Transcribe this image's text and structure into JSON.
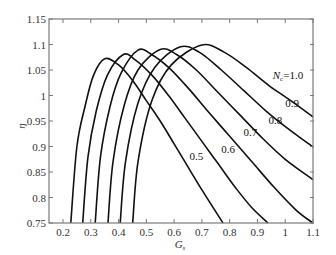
{
  "chart_data": {
    "type": "line",
    "title": "",
    "xlabel": "G_s",
    "ylabel": "η",
    "xlim": [
      0.15,
      1.1
    ],
    "ylim": [
      0.75,
      1.15
    ],
    "grid": false,
    "legend_position": "inline labels",
    "x_ticks": [
      0.2,
      0.3,
      0.4,
      0.5,
      0.6,
      0.7,
      0.8,
      0.9,
      1,
      1.1
    ],
    "y_ticks": [
      0.75,
      0.8,
      0.85,
      0.9,
      0.95,
      1,
      1.05,
      1.1,
      1.15
    ],
    "series": [
      {
        "name": "0.5",
        "label": "0.5",
        "x": [
          0.228,
          0.25,
          0.28,
          0.31,
          0.35,
          0.4,
          0.45,
          0.5,
          0.55,
          0.6,
          0.65,
          0.7,
          0.776
        ],
        "y": [
          0.75,
          0.9,
          0.98,
          1.04,
          1.072,
          1.06,
          1.03,
          0.99,
          0.95,
          0.905,
          0.86,
          0.815,
          0.75
        ]
      },
      {
        "name": "0.6",
        "label": "0.6",
        "x": [
          0.271,
          0.29,
          0.32,
          0.36,
          0.416,
          0.46,
          0.52,
          0.58,
          0.64,
          0.7,
          0.76,
          0.82,
          0.88,
          0.938
        ],
        "y": [
          0.75,
          0.88,
          0.97,
          1.04,
          1.08,
          1.07,
          1.04,
          1.0,
          0.955,
          0.91,
          0.865,
          0.82,
          0.78,
          0.75
        ]
      },
      {
        "name": "0.7",
        "label": "0.7",
        "x": [
          0.316,
          0.335,
          0.37,
          0.41,
          0.47,
          0.52,
          0.58,
          0.65,
          0.72,
          0.8,
          0.88,
          0.96,
          1.04,
          1.1
        ],
        "y": [
          0.75,
          0.88,
          0.98,
          1.045,
          1.089,
          1.08,
          1.055,
          1.015,
          0.97,
          0.92,
          0.87,
          0.82,
          0.775,
          0.75
        ]
      },
      {
        "name": "0.8",
        "label": "0.8",
        "x": [
          0.362,
          0.38,
          0.42,
          0.47,
          0.55,
          0.61,
          0.68,
          0.76,
          0.84,
          0.92,
          1.0,
          1.1
        ],
        "y": [
          0.75,
          0.87,
          0.98,
          1.05,
          1.09,
          1.08,
          1.05,
          1.005,
          0.96,
          0.915,
          0.875,
          0.835
        ]
      },
      {
        "name": "0.9",
        "label": "0.9",
        "x": [
          0.406,
          0.425,
          0.47,
          0.53,
          0.62,
          0.69,
          0.77,
          0.85,
          0.93,
          1.01,
          1.1
        ],
        "y": [
          0.75,
          0.87,
          0.985,
          1.055,
          1.095,
          1.085,
          1.05,
          1.01,
          0.97,
          0.935,
          0.899
        ]
      },
      {
        "name": "1.0",
        "label": "N_c=1.0",
        "x": [
          0.451,
          0.47,
          0.52,
          0.59,
          0.7,
          0.78,
          0.86,
          0.94,
          1.02,
          1.1
        ],
        "y": [
          0.75,
          0.87,
          0.99,
          1.06,
          1.099,
          1.085,
          1.055,
          1.02,
          0.99,
          0.958
        ]
      }
    ],
    "annotations": [
      {
        "text": "N_c=1.0",
        "x": 1.02,
        "y": 1.033
      },
      {
        "text": "0.9",
        "x": 1.0,
        "y": 0.977
      },
      {
        "text": "0.8",
        "x": 0.94,
        "y": 0.945
      },
      {
        "text": "0.7",
        "x": 0.85,
        "y": 0.92
      },
      {
        "text": "0.6",
        "x": 0.77,
        "y": 0.888
      },
      {
        "text": "0.5",
        "x": 0.655,
        "y": 0.873
      }
    ]
  },
  "axes": {
    "x_label_main": "G",
    "x_label_sub": "s",
    "y_label": "η",
    "nc_label_main": "N",
    "nc_label_sub": "c",
    "nc_label_value": "=1.0"
  }
}
